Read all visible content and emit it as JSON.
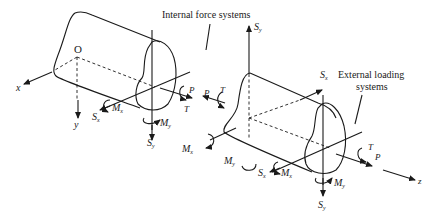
{
  "diagram": {
    "title_labels": {
      "internal": "Internal force systems",
      "external_line1": "External loading",
      "external_line2": "systems"
    },
    "left_body": {
      "origin": "O",
      "axis_x": "x",
      "axis_y": "y",
      "forces": {
        "Sx": "S",
        "Sx_sub": "x",
        "Mx": "M",
        "Mx_sub": "x",
        "Sy": "S",
        "Sy_sub": "y",
        "My": "M",
        "My_sub": "y",
        "P": "P",
        "T": "T"
      }
    },
    "right_body": {
      "axis_z": "z",
      "forces": {
        "Sy_top": "S",
        "Sy_top_sub": "y",
        "Sx_top": "S",
        "Sx_top_sub": "x",
        "P_left": "P",
        "T_left": "T",
        "Mx_left": "M",
        "Mx_left_sub": "x",
        "My_left": "M",
        "My_left_sub": "y",
        "Sx_bottom": "S",
        "Sx_bottom_sub": "x",
        "Mx_bottom": "M",
        "Mx_bottom_sub": "x",
        "My_right": "M",
        "My_right_sub": "y",
        "Sy_bottom": "S",
        "Sy_bottom_sub": "y",
        "T_right": "T",
        "P_right": "P"
      }
    }
  }
}
